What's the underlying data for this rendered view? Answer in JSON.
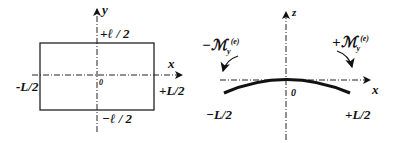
{
  "left_diagram": {
    "axis_y_label": "y",
    "axis_x_label": "x",
    "top_label": "+ℓ / 2",
    "bottom_label": "−ℓ / 2",
    "left_label": "-L/2",
    "right_label": "+L/2",
    "origin_label": "0"
  },
  "right_diagram": {
    "axis_z_label": "z",
    "axis_x_label": "x",
    "origin_label": "0",
    "left_label": "−L/2",
    "right_label": "+L/2",
    "left_moment_label": "−ℳ",
    "right_moment_label": "+ℳ",
    "moment_subscript": "y",
    "moment_superscript": "(e)"
  }
}
